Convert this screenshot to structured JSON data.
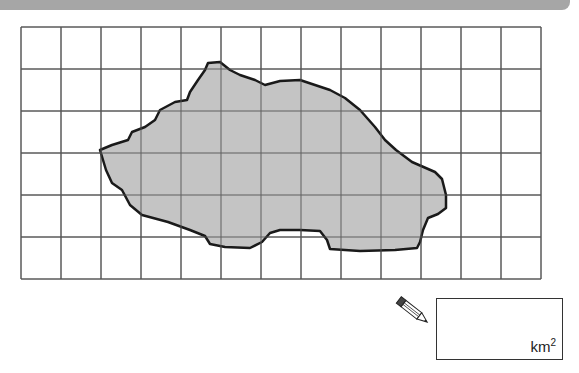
{
  "header": {
    "bar_color": "#a6a6a6"
  },
  "grid": {
    "columns": 13,
    "rows": 6,
    "left": 21,
    "top": 27,
    "cell_width": 40,
    "cell_height": 42,
    "line_color": "#555555"
  },
  "shape": {
    "fill": "#c4c4c4",
    "stroke": "#1a1a1a",
    "description": "irregular region (lake/island) to estimate area"
  },
  "answer": {
    "unit": "km",
    "unit_power": "2",
    "value": ""
  },
  "icons": {
    "pencil": "pencil-icon"
  }
}
